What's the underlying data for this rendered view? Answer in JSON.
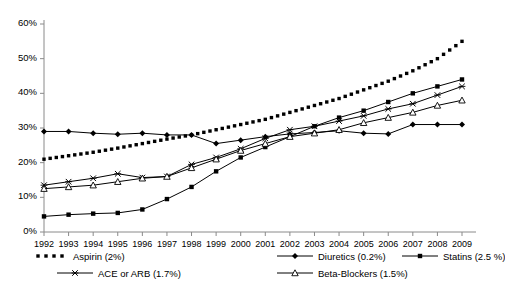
{
  "chart_data": {
    "type": "line",
    "title": "",
    "xlabel": "",
    "ylabel": "",
    "ylim": [
      0,
      60
    ],
    "ytick_labels": [
      "0%",
      "10%",
      "20%",
      "30%",
      "40%",
      "50%",
      "60%"
    ],
    "ytick_values": [
      0,
      10,
      20,
      30,
      40,
      50,
      60
    ],
    "grid": false,
    "legend_position": "bottom",
    "categories": [
      1992,
      1993,
      1994,
      1995,
      1996,
      1997,
      1998,
      1999,
      2000,
      2001,
      2002,
      2003,
      2004,
      2005,
      2006,
      2007,
      2008,
      2009
    ],
    "xtick_labels": [
      "1992",
      "1993",
      "1994",
      "1995",
      "1996",
      "1997",
      "1998",
      "1999",
      "2000",
      "2001",
      "2002",
      "2003",
      "2004",
      "2005",
      "2006",
      "2007",
      "2008",
      "2009"
    ],
    "series": [
      {
        "name": "Aspirin (2%)",
        "key": "aspirin",
        "marker": "dotted-square",
        "line": "none",
        "color": "#000000",
        "values": [
          21.0,
          22.0,
          23.0,
          24.2,
          25.5,
          26.8,
          28.0,
          29.5,
          31.0,
          32.5,
          34.5,
          36.5,
          38.5,
          41.0,
          43.5,
          46.5,
          50.0,
          55.0
        ]
      },
      {
        "name": "Diuretics (0.2%)",
        "key": "diuretics",
        "marker": "filled-diamond",
        "line": "solid",
        "color": "#000000",
        "values": [
          29.0,
          29.0,
          28.5,
          28.2,
          28.5,
          28.0,
          28.0,
          25.5,
          26.5,
          27.5,
          28.3,
          28.7,
          29.2,
          28.5,
          28.3,
          31.0,
          31.0,
          31.0
        ]
      },
      {
        "name": "Statins (2.5 %)",
        "key": "statins",
        "marker": "filled-square",
        "line": "solid",
        "color": "#000000",
        "values": [
          4.5,
          5.0,
          5.3,
          5.5,
          6.5,
          9.5,
          13.0,
          17.5,
          21.5,
          24.5,
          27.5,
          30.5,
          33.0,
          35.0,
          37.5,
          40.0,
          42.0,
          44.0
        ]
      },
      {
        "name": "ACE or ARB (1.7%)",
        "key": "ace_or_arb",
        "marker": "cross-x",
        "line": "solid",
        "color": "#000000",
        "values": [
          13.5,
          14.5,
          15.5,
          16.8,
          15.7,
          16.0,
          19.5,
          21.5,
          24.0,
          27.0,
          29.5,
          30.5,
          32.0,
          33.5,
          35.5,
          37.0,
          39.5,
          42.0
        ]
      },
      {
        "name": "Beta-Blockers (1.5%)",
        "key": "beta_blockers",
        "marker": "open-triangle",
        "line": "solid",
        "color": "#000000",
        "values": [
          12.5,
          13.0,
          13.5,
          14.5,
          15.5,
          16.0,
          18.5,
          21.0,
          23.5,
          25.5,
          27.5,
          28.5,
          29.5,
          31.5,
          33.0,
          34.5,
          36.5,
          38.0
        ]
      }
    ]
  },
  "legend": {
    "rows": [
      [
        {
          "key": "aspirin",
          "label": "Aspirin (2%)",
          "marker": "dotted-square",
          "line": "none"
        },
        {
          "key": "diuretics",
          "label": "Diuretics (0.2%)",
          "marker": "filled-diamond",
          "line": "solid"
        },
        {
          "key": "statins",
          "label": "Statins (2.5 %)",
          "marker": "filled-square",
          "line": "solid"
        }
      ],
      [
        {
          "key": "ace_or_arb",
          "label": "ACE or ARB (1.7%)",
          "marker": "cross-x",
          "line": "solid"
        },
        {
          "key": "beta_blockers",
          "label": "Beta-Blockers (1.5%)",
          "marker": "open-triangle",
          "line": "solid"
        }
      ]
    ]
  }
}
